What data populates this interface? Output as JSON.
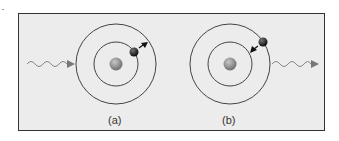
{
  "figure": {
    "panels": [
      {
        "id": "a",
        "label": "(a)",
        "description": "photon absorbed, electron moves outward"
      },
      {
        "id": "b",
        "label": "(b)",
        "description": "electron falls inward, photon emitted"
      }
    ],
    "colors": {
      "background": "#ececec",
      "border": "#333333",
      "orbit": "#444444",
      "nucleus": "#8a8a8a",
      "electron": "#1a1a1a",
      "photon": "#888888"
    }
  }
}
